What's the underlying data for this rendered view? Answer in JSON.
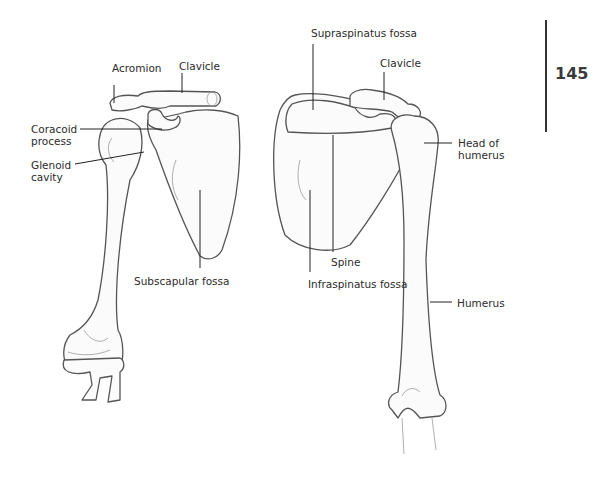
{
  "page": {
    "number": "145"
  },
  "figure": {
    "left_view": {
      "title": "anterior view of right shoulder",
      "labels": {
        "acromion": "Acromion",
        "clavicle": "Clavicle",
        "coracoid_line1": "Coracoid",
        "coracoid_line2": "process",
        "glenoid_line1": "Glenoid",
        "glenoid_line2": "cavity",
        "subscapular": "Subscapular fossa"
      }
    },
    "right_view": {
      "title": "posterior view of shoulder",
      "labels": {
        "supraspinatus": "Supraspinatus fossa",
        "clavicle": "Clavicle",
        "head_line1": "Head of",
        "head_line2": "humerus",
        "spine": "Spine",
        "infraspinatus": "Infraspinatus fossa",
        "humerus": "Humerus"
      }
    }
  }
}
